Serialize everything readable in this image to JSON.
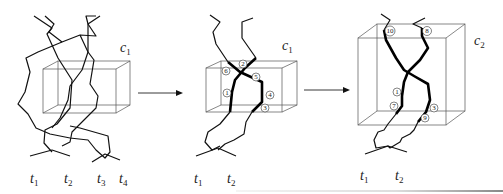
{
  "figure": {
    "type": "tangle-to-cube-transformation",
    "panels": [
      {
        "id": "panel-1",
        "cube_label": "c",
        "cube_subscript": "1",
        "tangle_labels": [
          {
            "t": "t",
            "sub": "1"
          },
          {
            "t": "t",
            "sub": "2"
          },
          {
            "t": "t",
            "sub": "3"
          },
          {
            "t": "t",
            "sub": "4"
          }
        ]
      },
      {
        "id": "panel-2",
        "cube_label": "c",
        "cube_subscript": "1",
        "tangle_labels": [
          {
            "t": "t",
            "sub": "1"
          },
          {
            "t": "t",
            "sub": "2"
          }
        ],
        "markers": [
          "6",
          "2",
          "5",
          "1",
          "4",
          "3"
        ]
      },
      {
        "id": "panel-3",
        "cube_label": "c",
        "cube_subscript": "2",
        "tangle_labels": [
          {
            "t": "t",
            "sub": "1"
          },
          {
            "t": "t",
            "sub": "2"
          }
        ],
        "markers": [
          "10",
          "8",
          "1",
          "7",
          "3",
          "9"
        ]
      }
    ],
    "arrows": [
      "arrow-1-to-2",
      "arrow-2-to-3"
    ],
    "colors": {
      "stroke": "#000000",
      "box": "#555555",
      "background": "#ffffff"
    }
  }
}
